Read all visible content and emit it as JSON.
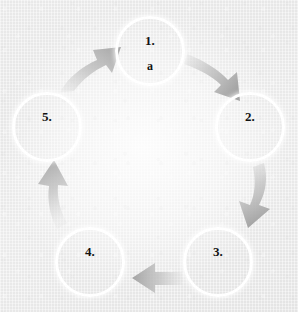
{
  "diagram": {
    "type": "cycle",
    "direction": "clockwise",
    "step_count": 5,
    "background_color": "#eeeeee",
    "circle_stroke_color": "#ffffff",
    "text_color": "#121212",
    "arrow_color": "#a8a8a8",
    "nodes": [
      {
        "id": "step-1",
        "number": "1.",
        "sub": "a",
        "cx": 150,
        "cy": 51,
        "r": 35
      },
      {
        "id": "step-2",
        "number": "2.",
        "sub": null,
        "cx": 250,
        "cy": 127,
        "r": 35
      },
      {
        "id": "step-3",
        "number": "3.",
        "sub": null,
        "cx": 218,
        "cy": 262,
        "r": 35
      },
      {
        "id": "step-4",
        "number": "4.",
        "sub": null,
        "cx": 90,
        "cy": 262,
        "r": 35
      },
      {
        "id": "step-5",
        "number": "5.",
        "sub": null,
        "cx": 47,
        "cy": 127,
        "r": 35
      }
    ],
    "arrows": [
      {
        "id": "arrow-1-to-2",
        "from": "step-1",
        "to": "step-2",
        "direction": "down-right"
      },
      {
        "id": "arrow-2-to-3",
        "from": "step-2",
        "to": "step-3",
        "direction": "down"
      },
      {
        "id": "arrow-3-to-4",
        "from": "step-3",
        "to": "step-4",
        "direction": "left"
      },
      {
        "id": "arrow-4-to-5",
        "from": "step-4",
        "to": "step-5",
        "direction": "up"
      },
      {
        "id": "arrow-5-to-1",
        "from": "step-5",
        "to": "step-1",
        "direction": "up-right"
      }
    ]
  }
}
